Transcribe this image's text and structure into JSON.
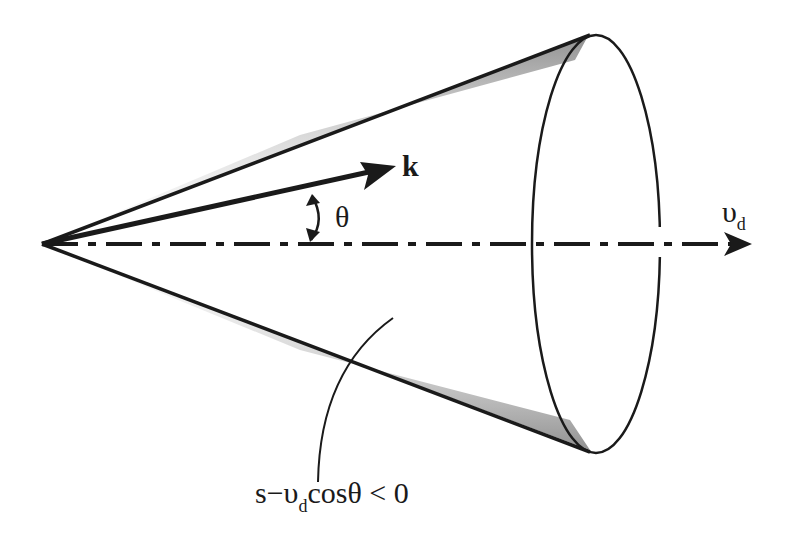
{
  "figure": {
    "labels": {
      "wave_vector": "k",
      "angle": "θ",
      "velocity_main": "υ",
      "velocity_sub": "d",
      "condition_prefix": "s−υ",
      "condition_sub": "d",
      "condition_suffix": "cosθ < 0"
    },
    "colors": {
      "ink": "#1a1a1a",
      "background": "#ffffff",
      "shading": "#9a9a9a"
    }
  }
}
